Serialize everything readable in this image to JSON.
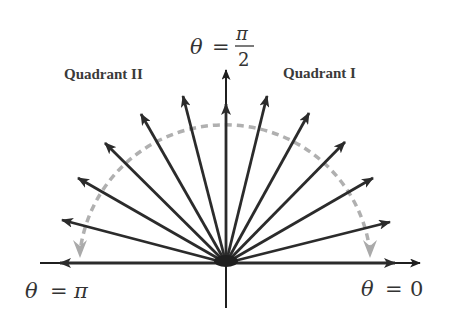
{
  "diagram": {
    "labels": {
      "quadrant_2": "Quadrant II",
      "quadrant_1": "Quadrant I",
      "theta_pi_over_2": {
        "lhs": "θ",
        "eq": "=",
        "numerator": "π",
        "denominator": "2"
      },
      "theta_pi": {
        "lhs": "θ",
        "eq": "=",
        "rhs": "π"
      },
      "theta_zero": {
        "lhs": "θ",
        "eq": "=",
        "rhs": "0"
      }
    },
    "origin": [
      226,
      262
    ],
    "arrow_angles_deg": [
      0,
      15,
      30,
      45,
      60,
      75,
      90,
      105,
      120,
      135,
      150,
      165,
      180
    ],
    "arc": {
      "style": "dashed",
      "from_angle": "0",
      "to_angle": "π",
      "direction": "counterclockwise arrowheads at both ends"
    },
    "colors": {
      "arrows": "#2b2b2b",
      "axes": "#1f1f1f",
      "arc": "#b0b0b0",
      "text": "#333333"
    }
  }
}
